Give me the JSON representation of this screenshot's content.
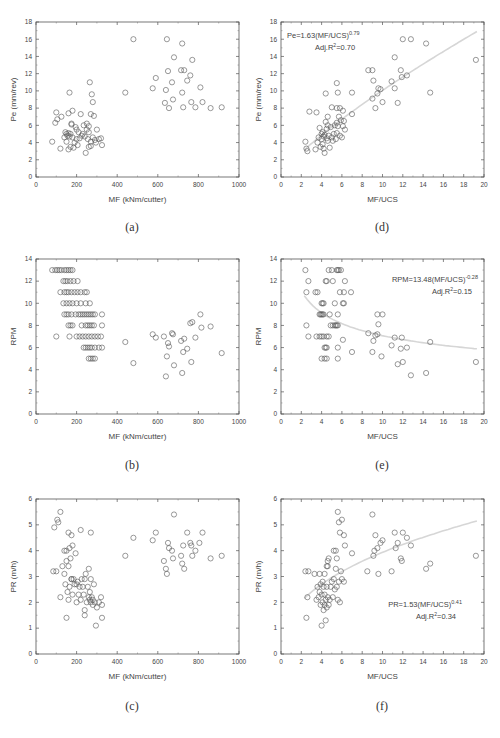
{
  "figure": {
    "captions": [
      "(a)",
      "(d)",
      "(b)",
      "(e)",
      "(c)",
      "(f)"
    ]
  },
  "chart_data": [
    {
      "id": "a",
      "type": "scatter",
      "caption": "(a)",
      "title": "",
      "xlabel": "MF (kNm/cutter)",
      "ylabel": "Pe (mm/rev)",
      "xlim": [
        0,
        1000
      ],
      "ylim": [
        0,
        18
      ],
      "xticks": [
        0,
        200,
        400,
        600,
        800,
        1000
      ],
      "yticks": [
        0,
        2,
        4,
        6,
        8,
        10,
        12,
        14,
        16,
        18
      ],
      "grid": false,
      "fit": null,
      "annotation": null,
      "x": [
        80,
        95,
        100,
        105,
        120,
        125,
        140,
        145,
        150,
        150,
        155,
        160,
        160,
        165,
        165,
        170,
        170,
        175,
        180,
        180,
        185,
        190,
        195,
        200,
        200,
        205,
        210,
        215,
        220,
        225,
        230,
        235,
        240,
        245,
        250,
        250,
        255,
        260,
        260,
        265,
        270,
        270,
        275,
        280,
        280,
        285,
        290,
        295,
        300,
        310,
        320,
        325,
        160,
        175,
        260,
        270,
        440,
        480,
        575,
        590,
        635,
        640,
        645,
        650,
        655,
        670,
        675,
        680,
        715,
        720,
        720,
        725,
        730,
        745,
        760,
        765,
        770,
        785,
        810,
        820,
        860,
        915
      ],
      "y": [
        4.1,
        6.3,
        7.5,
        6.7,
        3.3,
        7.0,
        4.6,
        5.2,
        4.1,
        5.0,
        4.8,
        3.2,
        5.1,
        4.7,
        9.8,
        3.5,
        5.0,
        6.2,
        4.6,
        7.7,
        3.4,
        4.0,
        5.8,
        4.4,
        5.5,
        3.7,
        5.2,
        4.5,
        7.3,
        4.8,
        5.0,
        6.0,
        4.7,
        2.8,
        5.5,
        6.2,
        4.4,
        3.5,
        5.9,
        11.0,
        7.3,
        4.1,
        9.6,
        8.7,
        4.6,
        7.1,
        4.3,
        4.0,
        5.5,
        4.4,
        4.5,
        3.7,
        7.4,
        6.1,
        5.2,
        3.6,
        9.8,
        16.0,
        10.3,
        11.5,
        8.6,
        10.1,
        16.0,
        12.3,
        8.0,
        11.0,
        9.0,
        13.9,
        12.4,
        15.5,
        9.8,
        8.1,
        12.4,
        11.2,
        11.8,
        8.7,
        13.6,
        8.1,
        10.4,
        8.7,
        8.0,
        8.1,
        9.8
      ]
    },
    {
      "id": "d",
      "type": "scatter",
      "caption": "(d)",
      "title": "",
      "xlabel": "MF/UCS",
      "ylabel": "Pe (mm/rev)",
      "xlim": [
        0,
        20
      ],
      "ylim": [
        0,
        18
      ],
      "xticks": [
        0,
        2,
        4,
        6,
        8,
        10,
        12,
        14,
        16,
        18,
        20
      ],
      "yticks": [
        0,
        2,
        4,
        6,
        8,
        10,
        12,
        14,
        16,
        18
      ],
      "grid": false,
      "fit": {
        "a": 1.63,
        "b": 0.79,
        "xrange": [
          2.3,
          19.3
        ]
      },
      "annotation": {
        "equation": "Pe=1.63(MF/UCS)",
        "exponent": "0.79",
        "r2_label": "Adj.R",
        "r2_sup": "2",
        "r2_value": "=0.70"
      },
      "x": [
        2.4,
        2.5,
        2.6,
        2.8,
        3.4,
        3.5,
        3.6,
        3.7,
        3.8,
        3.9,
        4.0,
        4.0,
        4.1,
        4.1,
        4.2,
        4.2,
        4.3,
        4.3,
        4.4,
        4.5,
        4.5,
        4.6,
        4.6,
        4.7,
        4.8,
        4.9,
        5.0,
        5.1,
        5.2,
        5.3,
        5.4,
        5.5,
        5.5,
        5.6,
        5.7,
        5.8,
        5.9,
        6.0,
        6.1,
        6.2,
        6.3,
        4.4,
        4.6,
        5.0,
        5.5,
        5.8,
        6.1,
        7.0,
        5.5,
        5.6,
        7.0,
        8.6,
        9.0,
        9.1,
        9.0,
        9.3,
        9.5,
        9.6,
        9.8,
        10.0,
        10.9,
        11.2,
        11.5,
        11.8,
        11.9,
        12.4,
        11.2,
        12.0,
        12.8,
        14.3,
        14.7,
        19.2
      ],
      "y": [
        4.1,
        3.3,
        3.0,
        7.6,
        3.2,
        7.5,
        4.0,
        4.6,
        5.7,
        3.5,
        4.4,
        5.0,
        3.8,
        5.2,
        3.3,
        4.7,
        2.8,
        4.9,
        6.4,
        4.5,
        5.6,
        4.2,
        6.0,
        4.8,
        3.4,
        5.8,
        4.6,
        4.2,
        5.0,
        6.0,
        4.4,
        5.1,
        6.3,
        5.9,
        7.0,
        4.8,
        6.6,
        4.6,
        5.9,
        6.5,
        5.5,
        9.7,
        7.0,
        8.1,
        8.0,
        8.0,
        7.7,
        7.3,
        10.9,
        9.8,
        9.8,
        12.4,
        12.4,
        11.2,
        9.1,
        8.0,
        9.7,
        10.3,
        10.2,
        8.7,
        11.1,
        10.3,
        8.6,
        12.4,
        11.6,
        11.8,
        13.9,
        16.0,
        16.0,
        15.5,
        9.8,
        13.6
      ]
    },
    {
      "id": "b",
      "type": "scatter",
      "caption": "(b)",
      "title": "",
      "xlabel": "MF (kNm/cutter)",
      "ylabel": "RPM",
      "xlim": [
        0,
        1000
      ],
      "ylim": [
        0,
        14
      ],
      "xticks": [
        0,
        200,
        400,
        600,
        800,
        1000
      ],
      "yticks": [
        0,
        2,
        4,
        6,
        8,
        10,
        12,
        14
      ],
      "grid": false,
      "fit": null,
      "annotation": null,
      "x": [
        80,
        95,
        105,
        115,
        125,
        140,
        150,
        160,
        170,
        180,
        135,
        145,
        155,
        170,
        185,
        205,
        120,
        140,
        150,
        160,
        175,
        190,
        205,
        220,
        240,
        250,
        135,
        150,
        165,
        180,
        200,
        220,
        245,
        265,
        140,
        150,
        160,
        175,
        195,
        210,
        220,
        230,
        240,
        250,
        260,
        270,
        280,
        290,
        325,
        160,
        170,
        180,
        225,
        245,
        255,
        265,
        275,
        285,
        325,
        100,
        165,
        200,
        215,
        230,
        245,
        260,
        275,
        290,
        305,
        320,
        235,
        245,
        255,
        265,
        275,
        290,
        310,
        325,
        260,
        270,
        280,
        290,
        440,
        480,
        575,
        590,
        630,
        640,
        645,
        650,
        655,
        670,
        675,
        680,
        715,
        720,
        725,
        730,
        745,
        760,
        765,
        770,
        785,
        810,
        815,
        860,
        915
      ],
      "y": [
        13,
        13,
        13,
        13,
        13,
        13,
        13,
        13,
        13,
        13,
        12,
        12,
        12,
        12,
        12,
        12,
        11,
        11,
        11,
        11,
        11,
        11,
        11,
        11,
        11,
        11,
        10,
        10,
        10,
        10,
        10,
        10,
        10,
        10,
        9,
        9,
        9,
        9,
        9,
        9,
        9,
        9,
        9,
        9,
        9,
        9,
        9,
        9,
        9,
        8,
        8,
        8,
        8,
        8,
        8,
        8,
        8,
        8,
        8,
        7,
        7,
        7,
        7,
        7,
        7,
        7,
        7,
        7,
        7,
        7,
        6,
        6,
        6,
        6,
        6,
        6,
        6,
        6,
        5,
        5,
        5,
        5,
        6.5,
        4.6,
        7.2,
        6.9,
        7.0,
        3.4,
        5.2,
        6.4,
        6.1,
        7.3,
        7.2,
        4.4,
        6.6,
        3.7,
        5.6,
        6.8,
        5.9,
        8.2,
        4.7,
        8.3,
        6.9,
        9.0,
        7.8,
        7.9,
        5.5
      ]
    },
    {
      "id": "e",
      "type": "scatter",
      "caption": "(e)",
      "title": "",
      "xlabel": "MF/UCS",
      "ylabel": "RPM",
      "xlim": [
        0,
        20
      ],
      "ylim": [
        0,
        14
      ],
      "xticks": [
        0,
        2,
        4,
        6,
        8,
        10,
        12,
        14,
        16,
        18,
        20
      ],
      "yticks": [
        0,
        2,
        4,
        6,
        8,
        10,
        12,
        14
      ],
      "grid": false,
      "fit": {
        "a": 13.48,
        "b": -0.28,
        "xrange": [
          2.3,
          19.3
        ]
      },
      "annotation": {
        "equation": "RPM=13.48(MF/UCS)",
        "exponent": "-0.28",
        "r2_label": "Adj.R",
        "r2_sup": "2",
        "r2_value": "=0.15"
      },
      "x": [
        2.4,
        4.7,
        5.0,
        5.5,
        5.6,
        5.7,
        5.9,
        2.7,
        4.4,
        4.5,
        5.1,
        6.3,
        2.5,
        3.4,
        3.6,
        5.8,
        6.2,
        6.9,
        4.0,
        4.1,
        4.2,
        5.3,
        6.1,
        6.2,
        3.8,
        3.9,
        4.0,
        4.1,
        4.2,
        4.8,
        5.6,
        2.5,
        4.9,
        5.1,
        5.3,
        5.4,
        5.5,
        5.6,
        2.7,
        3.5,
        3.8,
        4.0,
        4.2,
        4.5,
        4.7,
        4.3,
        4.4,
        4.5,
        5.6,
        4.0,
        4.3,
        4.5,
        5.6,
        6.1,
        7.0,
        8.6,
        9.0,
        9.1,
        9.3,
        9.5,
        9.6,
        9.5,
        10.0,
        9.9,
        10.9,
        11.2,
        11.5,
        11.8,
        11.9,
        12.4,
        12.0,
        12.8,
        14.3,
        14.7,
        19.2
      ],
      "y": [
        13,
        13,
        13,
        13,
        13,
        13,
        13,
        12,
        12,
        12,
        12,
        12,
        11,
        11,
        11,
        11,
        11,
        11,
        10,
        10,
        10,
        10,
        10,
        10,
        9,
        9,
        9,
        9,
        9,
        9,
        9,
        8,
        8,
        8,
        8,
        8,
        8,
        8,
        7,
        7,
        7,
        7,
        7,
        7,
        7,
        6,
        6,
        6,
        6,
        5,
        5,
        5,
        5,
        6.7,
        5.6,
        7.3,
        5.6,
        6.6,
        7.1,
        9.0,
        8.1,
        7.2,
        9.0,
        5.2,
        6.2,
        6.9,
        4.5,
        5.9,
        6.9,
        6.0,
        4.7,
        3.5,
        3.7,
        6.5,
        4.7
      ]
    },
    {
      "id": "c",
      "type": "scatter",
      "caption": "(c)",
      "title": "",
      "xlabel": "MF (kNm/cutter)",
      "ylabel": "PR (m/h)",
      "xlim": [
        0,
        1000
      ],
      "ylim": [
        0,
        6
      ],
      "xticks": [
        0,
        200,
        400,
        600,
        800,
        1000
      ],
      "yticks": [
        0,
        1,
        2,
        3,
        4,
        5,
        6
      ],
      "grid": false,
      "fit": null,
      "annotation": null,
      "x": [
        85,
        90,
        100,
        105,
        110,
        120,
        120,
        130,
        140,
        140,
        145,
        150,
        150,
        155,
        160,
        160,
        165,
        165,
        170,
        175,
        175,
        180,
        180,
        185,
        190,
        195,
        200,
        200,
        205,
        210,
        215,
        220,
        225,
        230,
        235,
        240,
        240,
        245,
        250,
        255,
        260,
        260,
        265,
        265,
        270,
        270,
        275,
        280,
        280,
        285,
        290,
        295,
        300,
        310,
        320,
        325,
        325,
        160,
        175,
        220,
        270,
        150,
        240,
        440,
        480,
        575,
        590,
        630,
        640,
        645,
        650,
        655,
        670,
        675,
        680,
        715,
        720,
        725,
        730,
        745,
        760,
        765,
        770,
        785,
        805,
        820,
        860,
        915
      ],
      "y": [
        3.2,
        4.9,
        3.2,
        5.2,
        5.1,
        2.2,
        5.5,
        3.4,
        3.1,
        4.0,
        2.7,
        4.0,
        3.6,
        2.4,
        3.4,
        2.1,
        4.1,
        2.6,
        3.7,
        2.9,
        4.6,
        2.3,
        4.2,
        2.9,
        2.7,
        3.9,
        2.0,
        2.7,
        2.8,
        2.3,
        2.6,
        2.1,
        2.9,
        2.6,
        2.3,
        2.9,
        1.7,
        3.1,
        2.0,
        2.6,
        2.2,
        3.3,
        2.1,
        2.4,
        2.0,
        2.9,
        2.2,
        2.1,
        1.9,
        2.7,
        2.0,
        1.1,
        1.8,
        2.0,
        2.2,
        1.9,
        1.4,
        4.7,
        2.9,
        4.8,
        4.7,
        1.4,
        1.5,
        3.8,
        4.5,
        4.4,
        4.7,
        3.6,
        3.3,
        3.1,
        4.3,
        4.1,
        4.0,
        3.7,
        5.4,
        3.8,
        3.5,
        4.2,
        3.3,
        4.7,
        4.3,
        4.2,
        3.8,
        4.0,
        4.3,
        4.7,
        3.7,
        3.8,
        3.3
      ]
    },
    {
      "id": "f",
      "type": "scatter",
      "caption": "(f)",
      "title": "",
      "xlabel": "MF/UCS",
      "ylabel": "PR (m/h)",
      "xlim": [
        0,
        20
      ],
      "ylim": [
        0,
        6
      ],
      "xticks": [
        0,
        2,
        4,
        6,
        8,
        10,
        12,
        14,
        16,
        18,
        20
      ],
      "yticks": [
        0,
        1,
        2,
        3,
        4,
        5,
        6
      ],
      "grid": false,
      "fit": {
        "a": 1.53,
        "b": 0.41,
        "xrange": [
          2.3,
          19.3
        ]
      },
      "annotation": {
        "equation": "PR=1.53(MF/UCS)",
        "exponent": "0.41",
        "r2_label": "Adj.R",
        "r2_sup": "2",
        "r2_value": "=0.34"
      },
      "x": [
        2.4,
        2.5,
        2.6,
        2.7,
        3.3,
        3.5,
        3.6,
        3.7,
        3.8,
        3.8,
        3.9,
        3.9,
        4.0,
        4.0,
        4.1,
        4.1,
        4.2,
        4.2,
        4.3,
        4.3,
        4.4,
        4.4,
        4.5,
        4.5,
        4.6,
        4.6,
        4.7,
        4.7,
        4.8,
        4.9,
        5.0,
        5.1,
        5.2,
        5.3,
        5.4,
        5.5,
        5.6,
        5.7,
        5.8,
        5.9,
        6.0,
        6.2,
        4.3,
        4.5,
        4.6,
        5.2,
        5.4,
        5.5,
        5.6,
        5.7,
        5.8,
        6.0,
        6.2,
        6.3,
        7.0,
        8.5,
        9.0,
        9.1,
        9.2,
        9.3,
        9.5,
        9.6,
        9.8,
        10.0,
        10.9,
        11.2,
        11.3,
        11.5,
        11.8,
        11.9,
        12.0,
        12.4,
        12.8,
        14.3,
        14.7,
        19.2
      ],
      "y": [
        3.2,
        1.4,
        2.2,
        3.2,
        3.1,
        2.1,
        2.6,
        2.2,
        2.4,
        3.1,
        2.7,
        1.9,
        2.3,
        1.1,
        2.8,
        2.0,
        2.6,
        1.7,
        1.9,
        2.3,
        2.1,
        1.3,
        2.6,
        1.8,
        2.2,
        3.4,
        1.9,
        3.7,
        2.1,
        2.6,
        2.8,
        2.2,
        2.9,
        2.5,
        3.3,
        2.6,
        2.1,
        2.8,
        2.0,
        3.2,
        2.9,
        2.8,
        3.1,
        3.4,
        3.6,
        4.0,
        4.0,
        3.7,
        5.5,
        5.1,
        4.7,
        5.2,
        4.6,
        4.2,
        3.9,
        3.2,
        5.4,
        3.8,
        4.0,
        4.6,
        4.1,
        3.1,
        4.3,
        4.4,
        3.2,
        4.7,
        4.1,
        4.3,
        3.7,
        3.6,
        4.7,
        4.5,
        4.2,
        3.3,
        3.5,
        3.8
      ]
    }
  ]
}
